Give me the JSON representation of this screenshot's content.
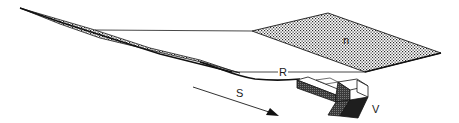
{
  "diagram": {
    "labels": {
      "plane": "n",
      "chord": "R",
      "arrow": "S",
      "block": "V"
    },
    "colors": {
      "line": "#1a1a1a",
      "stipple_bg": "#ffffff",
      "stipple_dot": "#2a2a2a",
      "block_dark": "#1e1e1e",
      "block_mid": "#5a5a5a",
      "block_light": "#ffffff"
    }
  }
}
